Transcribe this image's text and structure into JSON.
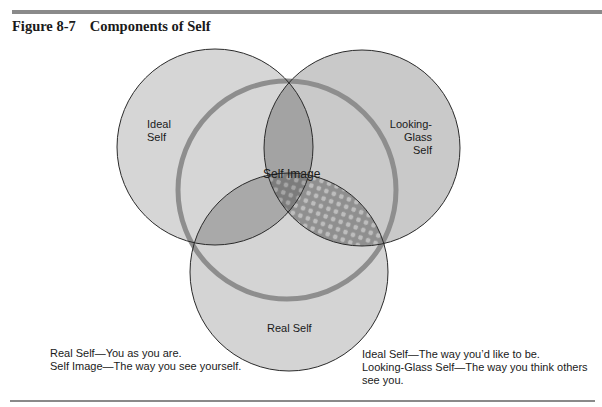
{
  "figure": {
    "number": "Figure 8-7",
    "title": "Components of Self"
  },
  "diagram": {
    "type": "venn",
    "circles": [
      {
        "id": "ideal",
        "label_lines": [
          "Ideal",
          "Self"
        ],
        "cx": 215,
        "cy": 147,
        "r": 98
      },
      {
        "id": "looking-glass",
        "label_lines": [
          "Looking-",
          "Glass",
          "Self"
        ],
        "cx": 362,
        "cy": 148,
        "r": 98
      },
      {
        "id": "real",
        "label_lines": [
          "Real Self"
        ],
        "cx": 289,
        "cy": 272,
        "r": 99
      }
    ],
    "ring": {
      "id": "self-image",
      "label": "Self Image",
      "cx": 287,
      "cy": 190,
      "r": 109
    },
    "colors": {
      "circle_fill": "#d6d6d6",
      "pair_overlap": "#a9a9a9",
      "ring": "#8e8e8e",
      "outline": "#2a2a2a"
    }
  },
  "legend": {
    "left": [
      "Real Self—You as you are.",
      "Self Image—The way you see yourself."
    ],
    "right": [
      "Ideal Self—The way you’d like to be.",
      "Looking-Glass Self—The way you think others",
      "see you."
    ]
  }
}
